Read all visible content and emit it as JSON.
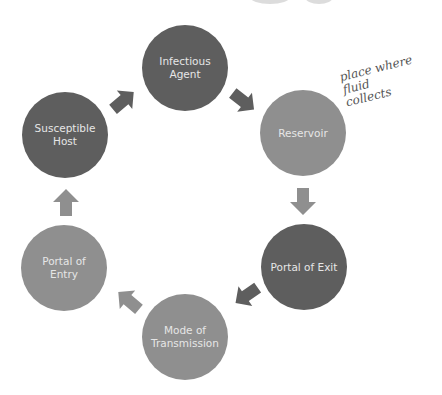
{
  "diagram": {
    "nodes": [
      {
        "id": "infectious-agent",
        "label": "Infectious Agent",
        "shade": "dark"
      },
      {
        "id": "reservoir",
        "label": "Reservoir",
        "shade": "light"
      },
      {
        "id": "portal-of-exit",
        "label": "Portal of Exit",
        "shade": "dark"
      },
      {
        "id": "mode-of-transmission",
        "label": "Mode of Transmission",
        "shade": "light"
      },
      {
        "id": "portal-of-entry",
        "label": "Portal of Entry",
        "shade": "light"
      },
      {
        "id": "susceptible-host",
        "label": "Susceptible Host",
        "shade": "dark"
      }
    ],
    "edges": [
      {
        "from": "infectious-agent",
        "to": "reservoir"
      },
      {
        "from": "reservoir",
        "to": "portal-of-exit"
      },
      {
        "from": "portal-of-exit",
        "to": "mode-of-transmission"
      },
      {
        "from": "mode-of-transmission",
        "to": "portal-of-entry"
      },
      {
        "from": "portal-of-entry",
        "to": "susceptible-host"
      },
      {
        "from": "susceptible-host",
        "to": "infectious-agent"
      }
    ],
    "annotation": {
      "target": "reservoir",
      "text": "place where\nfluid\ncollects",
      "style": "handwritten"
    },
    "colors": {
      "dark": "#5e5e5e",
      "light": "#8f8f8f",
      "text": "#e6e6e6",
      "background": "#ffffff"
    }
  }
}
